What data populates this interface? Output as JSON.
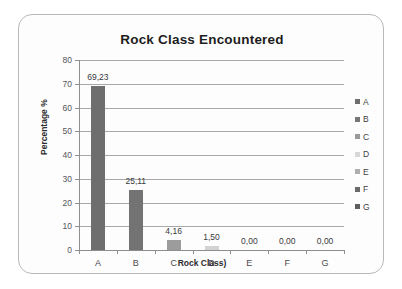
{
  "chart_data": {
    "type": "bar",
    "title": "Rock Class Encountered",
    "xlabel": "Rock Class)",
    "ylabel": "Percentage %",
    "categories": [
      "A",
      "B",
      "C",
      "D",
      "E",
      "F",
      "G"
    ],
    "values": [
      69.23,
      25.11,
      4.16,
      1.5,
      0.0,
      0.0,
      0.0
    ],
    "data_labels": [
      "69,23",
      "25,11",
      "4,16",
      "1,50",
      "0,00",
      "0,00",
      "0,00"
    ],
    "ylim": [
      0,
      80
    ],
    "ytick_values": [
      0,
      10,
      20,
      30,
      40,
      50,
      60,
      70,
      80
    ],
    "ytick_labels": [
      "0",
      "10",
      "20",
      "30",
      "40",
      "50",
      "60",
      "70",
      "80"
    ],
    "grid": "horizontal",
    "legend_position": "right",
    "legend": [
      {
        "label": "A",
        "color": "#6e6e6e"
      },
      {
        "label": "B",
        "color": "#777777"
      },
      {
        "label": "C",
        "color": "#9a9a9a"
      },
      {
        "label": "D",
        "color": "#d8d8d8"
      },
      {
        "label": "E",
        "color": "#aeaeae"
      },
      {
        "label": "F",
        "color": "#6a6a6a"
      },
      {
        "label": "G",
        "color": "#5f5f5f"
      }
    ],
    "bar_colors": [
      "#6e6e6e",
      "#737373",
      "#9c9c9c",
      "#d3d3d3",
      "#b4b4b4",
      "#6a6a6a",
      "#5f5f5f"
    ]
  }
}
